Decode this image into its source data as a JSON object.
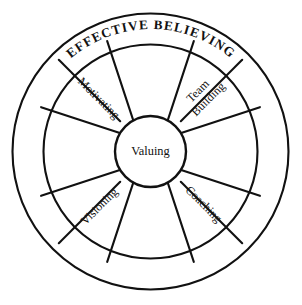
{
  "diagram": {
    "title": "EFFECTIVE BELIEVING",
    "type": "wheel-diagram",
    "center": {
      "label": "Valuing"
    },
    "spokes": [
      {
        "id": "motivating",
        "label": "Motivating",
        "position": "upper-left",
        "angle_deg": 225
      },
      {
        "id": "team-building",
        "label": "Team Building",
        "line1": "Team",
        "line2": "Building",
        "position": "upper-right",
        "angle_deg": 315
      },
      {
        "id": "visioning",
        "label": "Visioning",
        "position": "lower-left",
        "angle_deg": 135
      },
      {
        "id": "coaching",
        "label": "Coaching",
        "position": "lower-right",
        "angle_deg": 45
      }
    ],
    "colors": {
      "stroke": "#111111",
      "background": "#ffffff",
      "text": "#111111"
    }
  }
}
